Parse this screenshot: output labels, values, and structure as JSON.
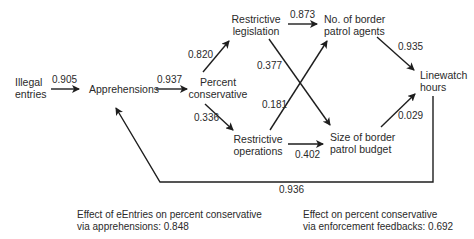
{
  "nodes": {
    "illegal_entries": [
      "Illegal",
      "entries"
    ],
    "apprehensions": [
      "Apprehensions"
    ],
    "percent_conservative": [
      "Percent",
      "conservative"
    ],
    "restrictive_legislation": [
      "Restrictive",
      "legislation"
    ],
    "restrictive_operations": [
      "Restrictive",
      "operations"
    ],
    "border_patrol_agents": [
      "No. of border",
      "patrol agents"
    ],
    "border_patrol_budget": [
      "Size of border",
      "patrol budget"
    ],
    "linewatch_hours": [
      "Linewatch",
      "hours"
    ]
  },
  "edges": [
    {
      "from": "illegal_entries",
      "to": "apprehensions",
      "coefficient": "0.905"
    },
    {
      "from": "apprehensions",
      "to": "percent_conservative",
      "coefficient": "0.937"
    },
    {
      "from": "percent_conservative",
      "to": "restrictive_legislation",
      "coefficient": "0.820"
    },
    {
      "from": "percent_conservative",
      "to": "restrictive_operations",
      "coefficient": "0.336"
    },
    {
      "from": "restrictive_legislation",
      "to": "border_patrol_agents",
      "coefficient": "0.873"
    },
    {
      "from": "restrictive_legislation",
      "to": "border_patrol_budget",
      "coefficient": "0.377"
    },
    {
      "from": "restrictive_operations",
      "to": "border_patrol_agents",
      "coefficient": "0.181"
    },
    {
      "from": "restrictive_operations",
      "to": "border_patrol_budget",
      "coefficient": "0.402"
    },
    {
      "from": "border_patrol_agents",
      "to": "linewatch_hours",
      "coefficient": "0.935"
    },
    {
      "from": "border_patrol_budget",
      "to": "linewatch_hours",
      "coefficient": "0.029"
    },
    {
      "from": "linewatch_hours",
      "to": "apprehensions",
      "coefficient": "0.936"
    }
  ],
  "notes": {
    "entries_effect": [
      "Effect of eEntries on percent conservative",
      "via apprehensions: 0.848"
    ],
    "enforcement_effect": [
      "Effect on percent conservative",
      "via enforcement feedbacks: 0.692"
    ]
  }
}
